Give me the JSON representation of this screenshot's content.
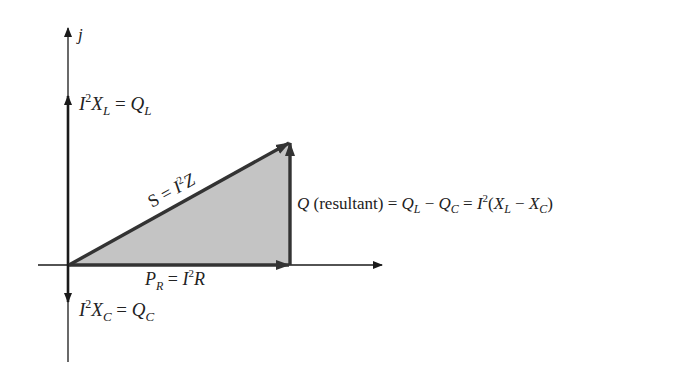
{
  "diagram": {
    "axis": {
      "imag_label": "j"
    },
    "labels": {
      "ql": {
        "base": "I",
        "sup": "2",
        "x": "X",
        "sub": "L",
        "eq": " = ",
        "q": "Q",
        "qsub": "L"
      },
      "qc": {
        "base": "I",
        "sup": "2",
        "x": "X",
        "sub": "C",
        "eq": " = ",
        "q": "Q",
        "qsub": "C"
      },
      "s": {
        "s": "S",
        "eq": " = ",
        "i": "I",
        "sup": "2",
        "z": "Z"
      },
      "pr": {
        "p": "P",
        "sub": "R",
        "eq": " = ",
        "i": "I",
        "sup": "2",
        "r": "R"
      },
      "q": {
        "q": "Q",
        "paren": " (resultant) ",
        "eq1": "= ",
        "ql": "Q",
        "qlsub": "L",
        "minus": " − ",
        "qc": "Q",
        "qcsub": "C",
        "eq2": " = ",
        "i": "I",
        "sup": "2",
        "open": "(",
        "xl": "X",
        "xlsub": "L",
        "minus2": " − ",
        "xc": "X",
        "xcsub": "C",
        "close": ")"
      }
    },
    "colors": {
      "axis": "#1a1a1a",
      "vector": "#333333",
      "fill": "#c4c4c4"
    }
  }
}
